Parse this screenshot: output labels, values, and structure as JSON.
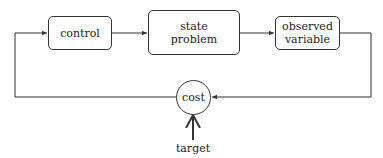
{
  "diagram": {
    "nodes": {
      "control": {
        "label": "control"
      },
      "state_problem": {
        "line1": "state",
        "line2": "problem"
      },
      "observed_variable": {
        "line1": "observed",
        "line2": "variable"
      },
      "cost": {
        "label": "cost"
      }
    },
    "input": {
      "label": "target"
    },
    "edges": [
      {
        "from": "control",
        "to": "state problem"
      },
      {
        "from": "state problem",
        "to": "observed variable"
      },
      {
        "from": "observed variable",
        "to": "cost"
      },
      {
        "from": "cost",
        "to": "control"
      },
      {
        "from": "target",
        "to": "cost"
      }
    ]
  }
}
